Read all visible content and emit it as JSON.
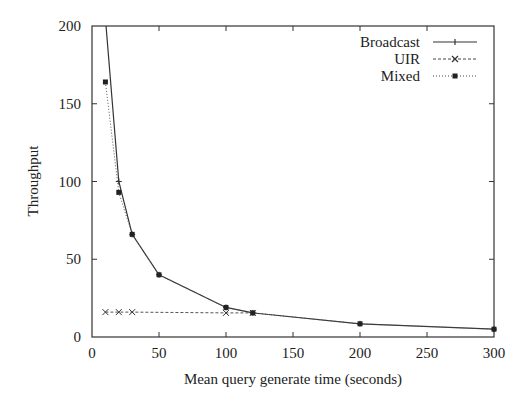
{
  "chart_data": {
    "type": "line",
    "title": "",
    "xlabel": "Mean query generate time (seconds)",
    "ylabel": "Throughput",
    "xlim": [
      0,
      300
    ],
    "ylim": [
      0,
      200
    ],
    "xticks": [
      0,
      50,
      100,
      150,
      200,
      250,
      300
    ],
    "yticks": [
      0,
      50,
      100,
      150,
      200
    ],
    "grid": false,
    "legend_position": "top-right",
    "series": [
      {
        "name": "Broadcast",
        "style": "solid",
        "marker": "plus",
        "x": [
          10,
          20,
          30,
          50,
          100,
          120,
          200,
          300
        ],
        "y": [
          205,
          100,
          66,
          40,
          19,
          15.5,
          8.5,
          5
        ]
      },
      {
        "name": "UIR",
        "style": "dashed",
        "marker": "cross",
        "x": [
          10,
          20,
          30,
          100,
          120
        ],
        "y": [
          16,
          16,
          16,
          15.5,
          15.5
        ]
      },
      {
        "name": "Mixed",
        "style": "dotted",
        "marker": "filled-square",
        "x": [
          10,
          20,
          30,
          50,
          100,
          120,
          200,
          300
        ],
        "y": [
          164,
          93,
          66,
          40,
          19,
          15.5,
          8.5,
          5
        ]
      }
    ]
  },
  "legend": {
    "items": [
      {
        "label": "Broadcast"
      },
      {
        "label": "UIR"
      },
      {
        "label": "Mixed"
      }
    ]
  },
  "axes": {
    "x_title": "Mean query generate time (seconds)",
    "y_title": "Throughput",
    "x_tick_labels": [
      "0",
      "50",
      "100",
      "150",
      "200",
      "250",
      "300"
    ],
    "y_tick_labels": [
      "0",
      "50",
      "100",
      "150",
      "200"
    ]
  }
}
